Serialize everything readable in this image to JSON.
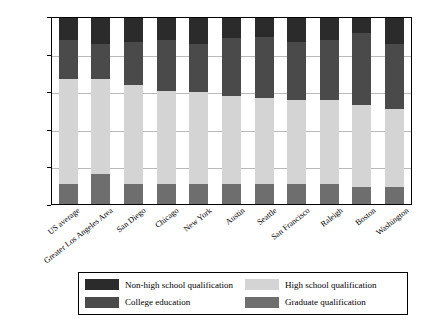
{
  "chart_data": {
    "type": "bar",
    "subtype": "stacked-bar",
    "title": "",
    "xlabel": "",
    "ylabel": "Percentage of population (%)",
    "ylim": [
      0,
      100
    ],
    "yticks": [
      0,
      20,
      40,
      60,
      80,
      100
    ],
    "ytick_labels": [
      "0",
      "20",
      "40",
      "60",
      "80",
      "100"
    ],
    "grid": true,
    "grid_axis": "y",
    "legend_position": "bottom",
    "stack_order_bottom_to_top": [
      "Graduate qualification",
      "High school qualification",
      "College education",
      "Non-high school qualification"
    ],
    "categories": [
      "US average",
      "Greater Los Angeles Area",
      "San Diego",
      "Chicago",
      "New York",
      "Austin",
      "Seattle",
      "San Francisco",
      "Raleigh",
      "Boston",
      "Washington"
    ],
    "series": [
      {
        "name": "Graduate qualification",
        "color": "#6e6e6e",
        "values": [
          11,
          16,
          11,
          11,
          11,
          11,
          11,
          11,
          11,
          9,
          9
        ]
      },
      {
        "name": "High school qualification",
        "color": "#d4d4d4",
        "values": [
          56,
          51,
          53,
          50,
          49,
          47,
          46,
          45,
          45,
          44,
          42
        ]
      },
      {
        "name": "College education",
        "color": "#4a4a4a",
        "values": [
          21,
          19,
          23,
          27,
          26,
          31,
          33,
          31,
          32,
          39,
          35
        ]
      },
      {
        "name": "Non-high school qualification",
        "color": "#2b2b2b",
        "values": [
          12,
          14,
          13,
          12,
          14,
          11,
          10,
          13,
          12,
          8,
          14
        ]
      }
    ],
    "cumulative_tops": {
      "US average": [
        11,
        67,
        88,
        100
      ],
      "Greater Los Angeles Area": [
        16,
        67,
        86,
        100
      ],
      "San Diego": [
        11,
        64,
        87,
        100
      ],
      "Chicago": [
        11,
        61,
        88,
        100
      ],
      "New York": [
        11,
        60,
        86,
        100
      ],
      "Austin": [
        11,
        58,
        89,
        100
      ],
      "Seattle": [
        11,
        57,
        90,
        100
      ],
      "San Francisco": [
        11,
        56,
        87,
        100
      ],
      "Raleigh": [
        11,
        56,
        88,
        100
      ],
      "Boston": [
        9,
        53,
        92,
        100
      ],
      "Washington": [
        9,
        51,
        86,
        100
      ]
    }
  },
  "legend": {
    "items": [
      {
        "label": "Non-high school qualification",
        "color": "#2b2b2b"
      },
      {
        "label": "High school qualification",
        "color": "#d4d4d4"
      },
      {
        "label": "College education",
        "color": "#4a4a4a"
      },
      {
        "label": "Graduate qualification",
        "color": "#6e6e6e"
      }
    ]
  },
  "colors": {
    "background": "#ffffff",
    "axis": "#000000",
    "gridline": "#b9b9b9",
    "non_high_school": "#2b2b2b",
    "college": "#4a4a4a",
    "graduate": "#6e6e6e",
    "high_school": "#d4d4d4"
  }
}
